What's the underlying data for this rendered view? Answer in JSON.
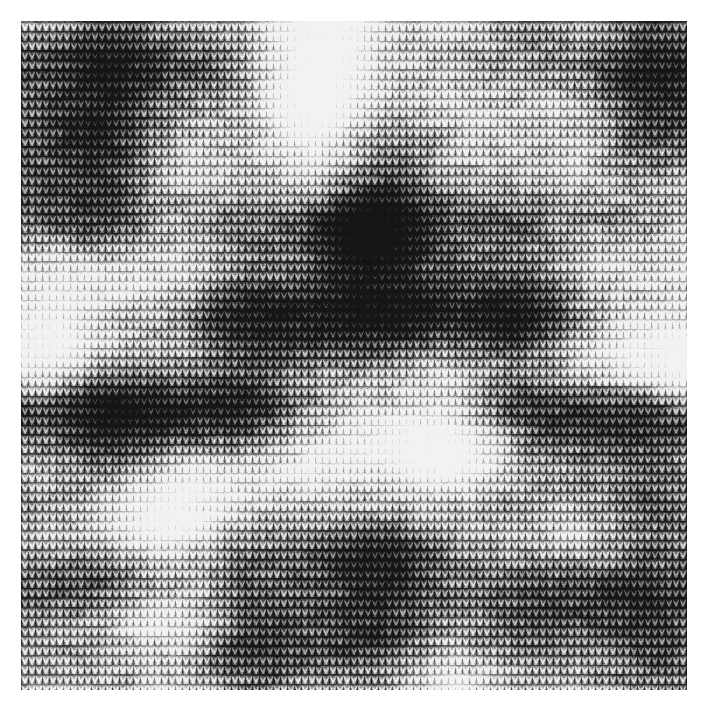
{
  "image": {
    "kind": "natural-image",
    "subject": "knitted-fabric-swatch",
    "description": "Close-up photograph of grey space-dyed stockinette knit fabric",
    "canvas_width": 707,
    "canvas_height": 712,
    "background_color": "#ffffff",
    "caption": ""
  },
  "swatch": {
    "label": "knit fabric swatch",
    "x": 21,
    "y": 21,
    "width": 666,
    "height": 669,
    "border_color": "#ffffff"
  },
  "texture": {
    "type": "stockinette-jersey-knit",
    "stitch_width": 7.0,
    "row_height": 9.6,
    "column_count": 95,
    "row_count": 70,
    "yarn_style": "space-dyed marled grayscale",
    "base_gray": "#8a8a8a",
    "darkest_gray": "#161616",
    "lightest_gray": "#f2f2f2",
    "stitch_shading_depth": 0.42,
    "yarn_noise_amount": 0.3,
    "fiber_fuzz_amount": 0.18,
    "random_seed": 20240517
  },
  "shading_field": {
    "description": "Large soft luminance blotches from space-dyed yarn, normalised coords 0..1",
    "global_level": 0.44,
    "blobs": [
      {
        "name": "bright-top-center-band",
        "cx": 0.445,
        "cy": 0.115,
        "rx": 0.115,
        "ry": 0.175,
        "amp": 0.62,
        "rot": 8
      },
      {
        "name": "bright-top-center-wide",
        "cx": 0.47,
        "cy": 0.05,
        "rx": 0.19,
        "ry": 0.08,
        "amp": 0.4,
        "rot": 0
      },
      {
        "name": "dark-top-left",
        "cx": 0.15,
        "cy": 0.085,
        "rx": 0.18,
        "ry": 0.115,
        "amp": -0.4,
        "rot": -5
      },
      {
        "name": "dark-upper-left-mid",
        "cx": 0.075,
        "cy": 0.215,
        "rx": 0.125,
        "ry": 0.12,
        "amp": -0.34,
        "rot": 0
      },
      {
        "name": "mid-light-left-upper",
        "cx": 0.275,
        "cy": 0.205,
        "rx": 0.135,
        "ry": 0.105,
        "amp": 0.26,
        "rot": 12
      },
      {
        "name": "dark-center-blob",
        "cx": 0.525,
        "cy": 0.33,
        "rx": 0.145,
        "ry": 0.12,
        "amp": -0.58,
        "rot": -6
      },
      {
        "name": "dark-center-core",
        "cx": 0.505,
        "cy": 0.315,
        "rx": 0.085,
        "ry": 0.07,
        "amp": -0.3,
        "rot": 0
      },
      {
        "name": "mid-light-right-upper",
        "cx": 0.76,
        "cy": 0.165,
        "rx": 0.15,
        "ry": 0.13,
        "amp": 0.33,
        "rot": 0
      },
      {
        "name": "dark-top-right",
        "cx": 0.95,
        "cy": 0.09,
        "rx": 0.13,
        "ry": 0.12,
        "amp": -0.42,
        "rot": 0
      },
      {
        "name": "light-right-edge-upper",
        "cx": 1.01,
        "cy": 0.3,
        "rx": 0.12,
        "ry": 0.11,
        "amp": 0.3,
        "rot": 0
      },
      {
        "name": "bright-left-mid-band",
        "cx": 0.115,
        "cy": 0.43,
        "rx": 0.15,
        "ry": 0.09,
        "amp": 0.55,
        "rot": -10
      },
      {
        "name": "bright-left-edge-mid",
        "cx": 0.015,
        "cy": 0.47,
        "rx": 0.11,
        "ry": 0.095,
        "amp": 0.42,
        "rot": 0
      },
      {
        "name": "dark-mid-center",
        "cx": 0.43,
        "cy": 0.47,
        "rx": 0.175,
        "ry": 0.105,
        "amp": -0.4,
        "rot": 4
      },
      {
        "name": "dark-mid-right",
        "cx": 0.7,
        "cy": 0.43,
        "rx": 0.14,
        "ry": 0.105,
        "amp": -0.34,
        "rot": 0
      },
      {
        "name": "bright-right-mid-patch",
        "cx": 0.95,
        "cy": 0.47,
        "rx": 0.13,
        "ry": 0.1,
        "amp": 0.6,
        "rot": 0
      },
      {
        "name": "bright-right-edge-patch",
        "cx": 1.03,
        "cy": 0.52,
        "rx": 0.11,
        "ry": 0.09,
        "amp": 0.4,
        "rot": 0
      },
      {
        "name": "dark-lower-left-band",
        "cx": 0.175,
        "cy": 0.585,
        "rx": 0.2,
        "ry": 0.095,
        "amp": -0.46,
        "rot": -4
      },
      {
        "name": "bright-center-lower",
        "cx": 0.56,
        "cy": 0.59,
        "rx": 0.16,
        "ry": 0.085,
        "amp": 0.56,
        "rot": 2
      },
      {
        "name": "bright-center-lower-2",
        "cx": 0.62,
        "cy": 0.65,
        "rx": 0.145,
        "ry": 0.08,
        "amp": 0.46,
        "rot": 0
      },
      {
        "name": "dark-right-lower",
        "cx": 0.88,
        "cy": 0.62,
        "rx": 0.15,
        "ry": 0.11,
        "amp": -0.36,
        "rot": 0
      },
      {
        "name": "bright-diagonal-lowleft",
        "cx": 0.29,
        "cy": 0.715,
        "rx": 0.215,
        "ry": 0.075,
        "amp": 0.6,
        "rot": -8
      },
      {
        "name": "bright-lowleft-core",
        "cx": 0.185,
        "cy": 0.745,
        "rx": 0.13,
        "ry": 0.055,
        "amp": 0.38,
        "rot": -6
      },
      {
        "name": "dark-lower-center",
        "cx": 0.52,
        "cy": 0.79,
        "rx": 0.175,
        "ry": 0.085,
        "amp": -0.5,
        "rot": 0
      },
      {
        "name": "bright-lower-center-2",
        "cx": 0.545,
        "cy": 0.742,
        "rx": 0.12,
        "ry": 0.042,
        "amp": 0.45,
        "rot": 0
      },
      {
        "name": "bright-right-low",
        "cx": 0.8,
        "cy": 0.76,
        "rx": 0.15,
        "ry": 0.075,
        "amp": 0.4,
        "rot": 0
      },
      {
        "name": "dark-bottom-right",
        "cx": 0.88,
        "cy": 0.86,
        "rx": 0.165,
        "ry": 0.095,
        "amp": -0.44,
        "rot": 0
      },
      {
        "name": "dark-bottom-left",
        "cx": 0.06,
        "cy": 0.855,
        "rx": 0.13,
        "ry": 0.08,
        "amp": -0.32,
        "rot": 0
      },
      {
        "name": "bright-bottom-left",
        "cx": 0.175,
        "cy": 0.9,
        "rx": 0.145,
        "ry": 0.06,
        "amp": 0.48,
        "rot": 0
      },
      {
        "name": "dark-bottom-center",
        "cx": 0.46,
        "cy": 0.93,
        "rx": 0.19,
        "ry": 0.075,
        "amp": -0.4,
        "rot": 0
      },
      {
        "name": "bright-bottom-strip",
        "cx": 0.64,
        "cy": 0.975,
        "rx": 0.23,
        "ry": 0.055,
        "amp": 0.45,
        "rot": 0
      },
      {
        "name": "mid-bottom-left-strip",
        "cx": 0.15,
        "cy": 0.99,
        "rx": 0.18,
        "ry": 0.045,
        "amp": 0.28,
        "rot": 0
      }
    ],
    "stripe_rows": {
      "description": "Horizontal course-wise brightness ripple typical of space-dyed yarn",
      "frequency": 0.055,
      "amplitude": 0.16,
      "phase": 1.1
    },
    "wale_streaks": {
      "description": "Vertical wale-wise subtle streaking",
      "frequency": 0.21,
      "amplitude": 0.05,
      "phase": 0.4
    }
  }
}
